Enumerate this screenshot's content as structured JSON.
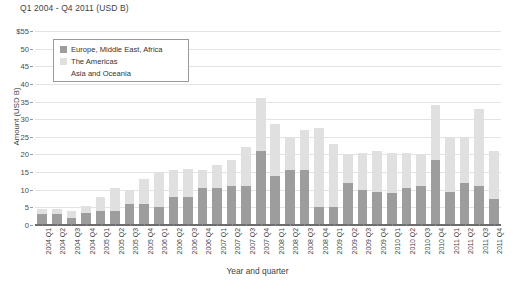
{
  "chart_data": {
    "type": "bar",
    "subtype": "stacked",
    "title": "Q1 2004 - Q4 2011 (USD B)",
    "xlabel": "Year and quarter",
    "ylabel": "Amount (USD B)",
    "ylim": [
      0,
      55
    ],
    "ytick_labels": [
      "$55",
      "50",
      "45",
      "40",
      "35",
      "30",
      "25",
      "20",
      "15",
      "10",
      "5",
      "0"
    ],
    "ytick_values": [
      55,
      50,
      45,
      40,
      35,
      30,
      25,
      20,
      15,
      10,
      5,
      0
    ],
    "grid": true,
    "legend_position": "upper-left-inside",
    "categories": [
      "2004 Q1",
      "2004 Q2",
      "2004 Q3",
      "2004 Q4",
      "2005 Q1",
      "2005 Q2",
      "2005 Q3",
      "2005 Q4",
      "2006 Q1",
      "2006 Q2",
      "2006 Q3",
      "2006 Q4",
      "2007 Q1",
      "2007 Q2",
      "2007 Q3",
      "2007 Q4",
      "2008 Q1",
      "2008 Q2",
      "2008 Q3",
      "2008 Q4",
      "2009 Q1",
      "2009 Q2",
      "2009 Q3",
      "2009 Q4",
      "2010 Q1",
      "2010 Q2",
      "2010 Q3",
      "2010 Q4",
      "2011 Q1",
      "2011 Q2",
      "2011 Q3",
      "2011 Q4"
    ],
    "series": [
      {
        "name": "Europe, Middle East, Africa",
        "color": "#9d9d9d",
        "values": [
          3.0,
          3.0,
          2.0,
          3.5,
          4.0,
          4.0,
          6.0,
          6.0,
          5.0,
          8.0,
          8.0,
          10.5,
          10.5,
          11.0,
          11.0,
          21.0,
          14.0,
          15.5,
          15.5,
          5.0,
          5.0,
          12.0,
          10.0,
          9.5,
          9.0,
          10.5,
          11.0,
          18.5,
          9.5,
          12.0,
          11.0,
          7.5
        ]
      },
      {
        "name": "The Americas",
        "color": "#e0e0e0",
        "values": [
          1.5,
          1.5,
          2.0,
          2.0,
          4.0,
          6.5,
          4.0,
          7.0,
          10.0,
          7.5,
          8.0,
          5.0,
          6.5,
          7.5,
          11.0,
          15.0,
          14.5,
          9.5,
          11.5,
          22.5,
          18.0,
          8.0,
          10.5,
          11.5,
          11.5,
          10.0,
          9.0,
          15.5,
          15.5,
          13.0,
          22.0,
          13.5
        ]
      },
      {
        "name": "Asia and Oceania",
        "color": "#fbfbfb",
        "values": [
          0.0,
          0.0,
          0.0,
          0.0,
          0.0,
          0.0,
          0.0,
          0.0,
          0.0,
          0.0,
          0.0,
          0.0,
          0.0,
          0.0,
          0.0,
          0.0,
          0.0,
          0.0,
          0.0,
          0.0,
          0.0,
          0.0,
          0.0,
          0.0,
          0.0,
          0.0,
          0.0,
          0.0,
          0.0,
          0.0,
          0.0,
          0.0
        ]
      }
    ],
    "totals": [
      4.5,
      4.5,
      4.0,
      5.5,
      8.0,
      10.5,
      10.0,
      13.0,
      15.0,
      15.5,
      16.0,
      15.5,
      17.0,
      18.5,
      22.0,
      36.0,
      28.5,
      25.0,
      27.0,
      27.5,
      23.0,
      20.0,
      20.5,
      21.0,
      20.5,
      20.5,
      20.0,
      34.0,
      25.0,
      25.0,
      33.0,
      21.0
    ]
  },
  "legend": {
    "items": [
      {
        "label": "Europe, Middle East, Africa",
        "color": "#9d9d9d"
      },
      {
        "label": "The Americas",
        "color": "#e0e0e0"
      },
      {
        "label": "Asia and Oceania",
        "color": "#ffffff"
      }
    ]
  }
}
